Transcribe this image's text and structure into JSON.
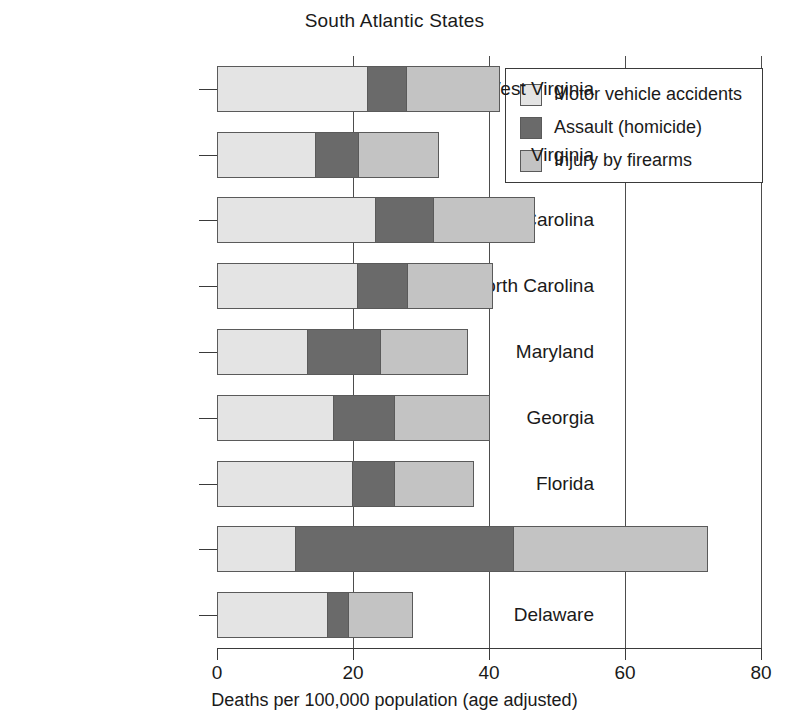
{
  "chart_data": {
    "type": "bar",
    "orientation": "horizontal",
    "stacked": true,
    "title": "South Atlantic States",
    "xlabel": "Deaths per 100,000 population (age adjusted)",
    "ylabel": "",
    "xlim": [
      0,
      80
    ],
    "xticks": [
      0,
      20,
      40,
      60,
      80
    ],
    "xticklabels": [
      "0",
      "20",
      "40",
      "60",
      "80"
    ],
    "grid": true,
    "grid_axis": "x",
    "legend_position": "upper right",
    "categories": [
      "West Virginia",
      "Virginia",
      "South Carolina",
      "North Carolina",
      "Maryland",
      "Georgia",
      "Florida",
      "District of Columbia",
      "Delaware"
    ],
    "series": [
      {
        "name": "Motor vehicle accidents",
        "color": "#e4e4e4",
        "values": [
          22.0,
          14.4,
          23.3,
          20.6,
          13.2,
          17.0,
          19.8,
          11.4,
          16.2
        ]
      },
      {
        "name": "Assault (homicide)",
        "color": "#6a6a6a",
        "values": [
          5.8,
          6.3,
          8.4,
          7.4,
          10.8,
          9.0,
          6.2,
          32.2,
          3.0
        ]
      },
      {
        "name": "Injury by firearms",
        "color": "#c3c3c3",
        "values": [
          13.6,
          11.8,
          14.9,
          12.5,
          12.7,
          14.0,
          11.6,
          28.4,
          9.5
        ]
      }
    ],
    "totals": [
      41.4,
      32.5,
      46.6,
      40.5,
      36.7,
      40.0,
      37.6,
      72.0,
      28.7
    ]
  },
  "legend": {
    "items": [
      {
        "label": "Motor vehicle accidents",
        "swatch": "#e4e4e4"
      },
      {
        "label": "Assault (homicide)",
        "swatch": "#6a6a6a"
      },
      {
        "label": "Injury by firearms",
        "swatch": "#c3c3c3"
      }
    ]
  }
}
